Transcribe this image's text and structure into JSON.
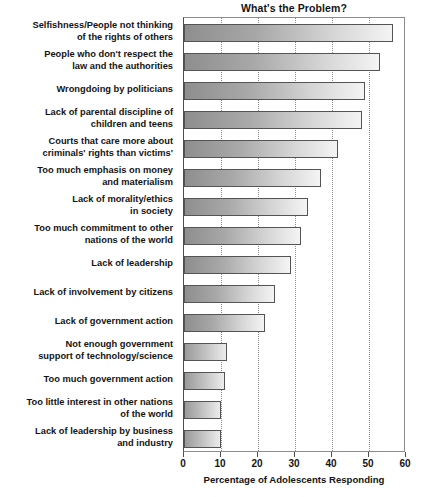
{
  "chart_data": {
    "type": "bar",
    "orientation": "horizontal",
    "title": "What's the Problem?",
    "xlabel": "Percentage of Adolescents Responding",
    "ylabel": "",
    "xlim": [
      0,
      60
    ],
    "xticks": [
      0,
      10,
      20,
      30,
      40,
      50,
      60
    ],
    "grid": true,
    "legend": null,
    "categories": [
      "Selfishness/People not thinking of the rights of others",
      "People who don't respect the law and the authorities",
      "Wrongdoing by politicians",
      "Lack of parental discipline of children and teens",
      "Courts that care more about criminals' rights than victims'",
      "Too much emphasis on money and materialism",
      "Lack of morality/ethics in society",
      "Too much commitment to other nations of the world",
      "Lack of leadership",
      "Lack of involvement by citizens",
      "Lack of government action",
      "Not enough government support of technology/science",
      "Too much government action",
      "Too little interest in other nations of the world",
      "Lack of leadership by business and industry"
    ],
    "category_lines": [
      [
        "Selfishness/People not thinking",
        "of the rights of others"
      ],
      [
        "People who don't respect the",
        "law and the authorities"
      ],
      [
        "Wrongdoing by politicians"
      ],
      [
        "Lack of parental discipline of",
        "children and teens"
      ],
      [
        "Courts that care more about",
        "criminals' rights than victims'"
      ],
      [
        "Too much emphasis on money",
        "and materialism"
      ],
      [
        "Lack of morality/ethics",
        "in society"
      ],
      [
        "Too much commitment to other",
        "nations of the world"
      ],
      [
        "Lack of leadership"
      ],
      [
        "Lack of involvement by citizens"
      ],
      [
        "Lack of government action"
      ],
      [
        "Not enough government",
        "support of technology/science"
      ],
      [
        "Too much government action"
      ],
      [
        "Too little interest in other nations",
        "of the world"
      ],
      [
        "Lack of leadership by business",
        "and industry"
      ]
    ],
    "values": [
      56.5,
      53,
      49,
      48,
      41.5,
      37,
      33.5,
      31.5,
      29,
      24.5,
      22,
      11.5,
      11,
      10,
      10
    ]
  },
  "colors": {
    "bar_start": "#8e8e8e",
    "bar_end": "#f4f4f4",
    "bar_border": "#545454",
    "grid": "#8f8f8f",
    "axis": "#4d4d4d",
    "text": "#141414",
    "background": "#ffffff"
  }
}
